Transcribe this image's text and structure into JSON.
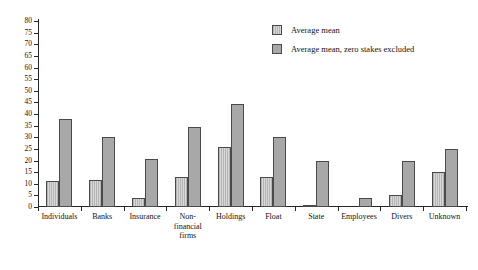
{
  "chart_data": {
    "type": "bar",
    "title": "",
    "subtitle": "",
    "xlabel": "",
    "ylabel": "",
    "ylim": [
      0,
      80
    ],
    "ytick_step": 5,
    "yticks": [
      0,
      5,
      10,
      15,
      20,
      25,
      30,
      35,
      40,
      45,
      50,
      55,
      60,
      65,
      70,
      75,
      80
    ],
    "grid": false,
    "legend_position": "top-right",
    "categories": [
      "Individuals",
      "Banks",
      "Insurance",
      "Non-financial firms",
      "Holdings",
      "Float",
      "State",
      "Employees",
      "Divers",
      "Unknown"
    ],
    "category_label_lines": [
      [
        "Individuals"
      ],
      [
        "Banks"
      ],
      [
        "Insurance"
      ],
      [
        "Non-",
        "financial",
        "firms"
      ],
      [
        "Holdings"
      ],
      [
        "Float"
      ],
      [
        "State"
      ],
      [
        "Employees"
      ],
      [
        "Divers"
      ],
      [
        "Unknown"
      ]
    ],
    "series": [
      {
        "name": "Average mean",
        "color": "#c4c4c4",
        "pattern": "vertical-hatch",
        "values": [
          11,
          11.5,
          4,
          13,
          26,
          13,
          0.5,
          0,
          5,
          15
        ]
      },
      {
        "name": "Average mean, zero stakes excluded",
        "color": "#a8a8a8",
        "pattern": "solid",
        "values": [
          38,
          30,
          20.5,
          34.5,
          44.5,
          30,
          20,
          4,
          20,
          25
        ]
      }
    ]
  },
  "legend": {
    "entries": [
      {
        "label": "Average mean"
      },
      {
        "label": "Average mean, zero stakes excluded"
      }
    ]
  },
  "axis": {
    "y_max_label": "80",
    "y_min_label": "0"
  }
}
